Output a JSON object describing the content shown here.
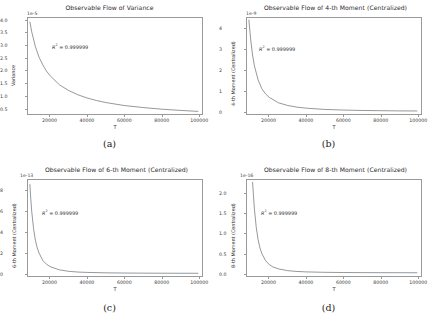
{
  "figure": {
    "background": "#ffffff",
    "curve_color": "#555f66",
    "axis_color": "#9a9a9a",
    "text_color": "#2b2b2b"
  },
  "shared": {
    "xlabel": "T",
    "xticks": [
      "20000",
      "40000",
      "60000",
      "80000",
      "100000"
    ],
    "r2_prefix": "R",
    "r2_sup": "2",
    "r2_value": "= 0.999999",
    "r2_text": "R2 = 0.999999"
  },
  "panels": [
    {
      "caption": "(a)",
      "title": "Observable Flow of Variance",
      "exponent": "1e-5",
      "ylabel": "Variance",
      "yticks": [
        "0.5",
        "1.0",
        "1.5",
        "2.0",
        "2.5",
        "3.0",
        "3.5",
        "4.0"
      ],
      "ytick_values": [
        0.5,
        1.0,
        1.5,
        2.0,
        2.5,
        3.0,
        3.5,
        4.0
      ],
      "r2": "R2 = 0.999999"
    },
    {
      "caption": "(b)",
      "title": "Observable Flow of 4-th Moment (Centralized)",
      "exponent": "1e-9",
      "ylabel": "4-th Moment (Centralized)",
      "yticks": [
        "0",
        "1",
        "2",
        "3",
        "4"
      ],
      "ytick_values": [
        0,
        1,
        2,
        3,
        4
      ],
      "r2": "R2 = 0.999999"
    },
    {
      "caption": "(c)",
      "title": "Observable Flow of 6-th Moment (Centralized)",
      "exponent": "1e-13",
      "ylabel": "6-th Moment (Centralized)",
      "yticks": [
        "0",
        "2",
        "4",
        "6",
        "8"
      ],
      "ytick_values": [
        0,
        2,
        4,
        6,
        8
      ],
      "r2": "R2 = 0.999999"
    },
    {
      "caption": "(d)",
      "title": "Observable Flow of 8-th Moment (Centralized)",
      "exponent": "1e-16",
      "ylabel": "8-th Moment (Centralized)",
      "yticks": [
        "0.0",
        "0.5",
        "1.0",
        "1.5",
        "2.0"
      ],
      "ytick_values": [
        0.0,
        0.5,
        1.0,
        1.5,
        2.0
      ],
      "r2": "R2 = 0.999999"
    }
  ],
  "chart_data": [
    {
      "type": "line",
      "panel": "a",
      "title": "Observable Flow of Variance",
      "xlabel": "T",
      "ylabel": "Variance",
      "y_exponent": "1e-5",
      "xlim": [
        8000,
        102000
      ],
      "ylim": [
        0.25,
        4.1
      ],
      "xticks": [
        20000,
        40000,
        60000,
        80000,
        100000
      ],
      "yticks": [
        0.5,
        1.0,
        1.5,
        2.0,
        2.5,
        3.0,
        3.5,
        4.0
      ],
      "grid": false,
      "annotation": "R2 = 0.999999",
      "x": [
        9000,
        10000,
        12000,
        14000,
        16000,
        18000,
        20000,
        25000,
        30000,
        35000,
        40000,
        45000,
        50000,
        60000,
        70000,
        80000,
        90000,
        100000
      ],
      "y": [
        3.95,
        3.55,
        2.95,
        2.52,
        2.22,
        1.97,
        1.78,
        1.42,
        1.19,
        1.02,
        0.89,
        0.79,
        0.71,
        0.59,
        0.51,
        0.445,
        0.395,
        0.355
      ]
    },
    {
      "type": "line",
      "panel": "b",
      "title": "Observable Flow of 4-th Moment (Centralized)",
      "xlabel": "T",
      "ylabel": "4-th Moment (Centralized)",
      "y_exponent": "1e-9",
      "xlim": [
        8000,
        102000
      ],
      "ylim": [
        -0.12,
        4.5
      ],
      "xticks": [
        20000,
        40000,
        60000,
        80000,
        100000
      ],
      "yticks": [
        0,
        1,
        2,
        3,
        4
      ],
      "grid": false,
      "annotation": "R2 = 0.999999",
      "x": [
        9000,
        10000,
        11000,
        12000,
        14000,
        16000,
        18000,
        20000,
        25000,
        30000,
        35000,
        40000,
        50000,
        60000,
        70000,
        80000,
        90000,
        100000
      ],
      "y": [
        4.42,
        3.45,
        2.72,
        2.2,
        1.52,
        1.1,
        0.85,
        0.68,
        0.42,
        0.29,
        0.21,
        0.16,
        0.1,
        0.07,
        0.05,
        0.04,
        0.03,
        0.025
      ]
    },
    {
      "type": "line",
      "panel": "c",
      "title": "Observable Flow of 6-th Moment (Centralized)",
      "xlabel": "T",
      "ylabel": "6-th Moment (Centralized)",
      "y_exponent": "1e-13",
      "xlim": [
        8000,
        102000
      ],
      "ylim": [
        -0.25,
        9.0
      ],
      "xticks": [
        20000,
        40000,
        60000,
        80000,
        100000
      ],
      "yticks": [
        0,
        2,
        4,
        6,
        8
      ],
      "grid": false,
      "annotation": "R2 = 0.999999",
      "x": [
        9000,
        9500,
        10000,
        11000,
        12000,
        13000,
        14000,
        16000,
        18000,
        20000,
        25000,
        30000,
        35000,
        40000,
        50000,
        60000,
        70000,
        80000,
        90000,
        100000
      ],
      "y": [
        8.6,
        7.2,
        6.0,
        4.3,
        3.2,
        2.45,
        1.95,
        1.25,
        0.88,
        0.65,
        0.34,
        0.2,
        0.13,
        0.095,
        0.055,
        0.035,
        0.025,
        0.018,
        0.014,
        0.011
      ]
    },
    {
      "type": "line",
      "panel": "d",
      "title": "Observable Flow of 8-th Moment (Centralized)",
      "xlabel": "T",
      "ylabel": "8-th Moment (Centralized)",
      "y_exponent": "1e-16",
      "xlim": [
        8000,
        102000
      ],
      "ylim": [
        -0.08,
        2.35
      ],
      "xticks": [
        20000,
        40000,
        60000,
        80000,
        100000
      ],
      "yticks": [
        0.0,
        0.5,
        1.0,
        1.5,
        2.0
      ],
      "grid": false,
      "annotation": "R2 = 0.999999",
      "x": [
        11000,
        11500,
        12000,
        13000,
        14000,
        15000,
        16000,
        18000,
        20000,
        22000,
        25000,
        30000,
        35000,
        40000,
        50000,
        60000,
        70000,
        80000,
        90000,
        100000
      ],
      "y": [
        2.3,
        1.95,
        1.62,
        1.15,
        0.84,
        0.63,
        0.49,
        0.31,
        0.21,
        0.15,
        0.1,
        0.055,
        0.035,
        0.024,
        0.013,
        0.008,
        0.005,
        0.004,
        0.003,
        0.002
      ]
    }
  ]
}
